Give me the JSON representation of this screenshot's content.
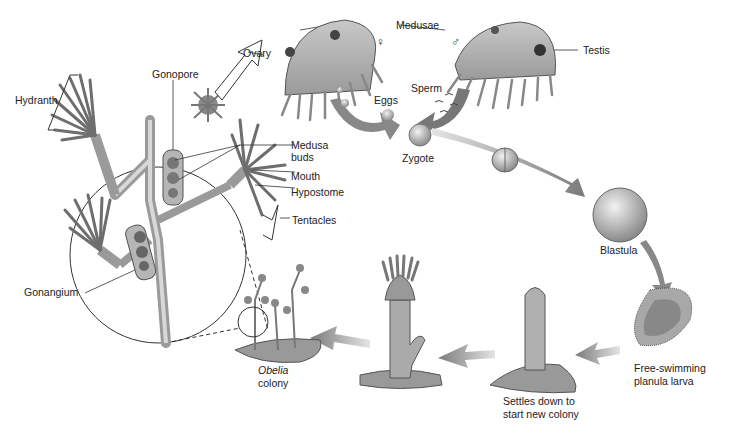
{
  "diagram": {
    "colors": {
      "ink": "#222222",
      "tissue": "#9a9a9a",
      "tissue_dark": "#6e6e6e",
      "arrow": "#8c8c8c",
      "background": "#ffffff"
    },
    "labels": {
      "hydranth": "Hydranth",
      "gonopore": "Gonopore",
      "ovary": "Ovary",
      "medusae": "Medusae",
      "female_symbol": "♀",
      "male_symbol": "♂",
      "testis": "Testis",
      "eggs": "Eggs",
      "sperm": "Sperm",
      "zygote": "Zygote",
      "medusa_buds_line1": "Medusa",
      "medusa_buds_line2": "buds",
      "mouth": "Mouth",
      "hypostome": "Hypostome",
      "tentacles": "Tentacles",
      "gonangium": "Gonangium",
      "blastula": "Blastula",
      "planula_line1": "Free-swimming",
      "planula_line2": "planula larva",
      "settles_line1": "Settles down to",
      "settles_line2": "start new colony",
      "obelia_line1": "Obelia",
      "obelia_line2": "colony"
    },
    "stages": [
      "Medusae",
      "Eggs",
      "Sperm",
      "Zygote",
      "Blastula",
      "Free-swimming planula larva",
      "Settles down to start new colony",
      "Polyp",
      "Obelia colony"
    ]
  }
}
